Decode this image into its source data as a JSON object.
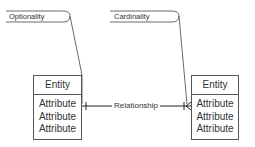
{
  "callouts": {
    "optionality": "Optionality",
    "cardinality": "Cardinality"
  },
  "entities": [
    {
      "title": "Entity",
      "attributes": [
        "Attribute",
        "Attribute",
        "Attribute"
      ]
    },
    {
      "title": "Entity",
      "attributes": [
        "Attribute",
        "Attribute",
        "Attribute"
      ]
    }
  ],
  "relationship": {
    "label": "Relationship",
    "left_end": "one (bar)",
    "right_end": "one-or-many (bar + crow's foot)"
  },
  "colors": {
    "line": "#333333",
    "box_border": "#555555",
    "text": "#333333"
  }
}
